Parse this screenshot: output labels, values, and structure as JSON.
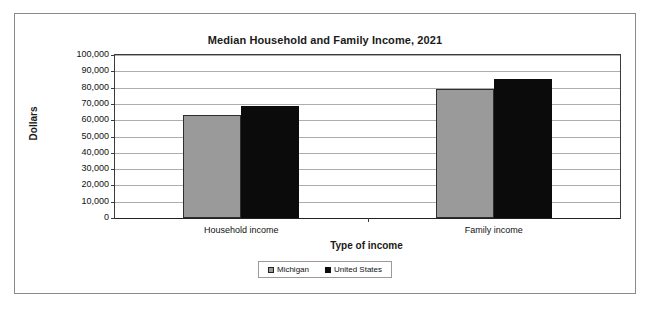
{
  "chart_data": {
    "type": "bar",
    "title": "Median Household and Family Income, 2021",
    "xlabel": "Type of income",
    "ylabel": "Dollars",
    "categories": [
      "Household income",
      "Family income"
    ],
    "series": [
      {
        "name": "Michigan",
        "color": "#9a9a9a",
        "values": [
          63000,
          79000
        ]
      },
      {
        "name": "United States",
        "color": "#0b0b0b",
        "values": [
          69000,
          85000
        ]
      }
    ],
    "ylim": [
      0,
      100000
    ],
    "ytick_values": [
      100000,
      90000,
      80000,
      70000,
      60000,
      50000,
      40000,
      30000,
      20000,
      10000,
      0
    ],
    "ytick_labels": [
      "100,000",
      "90,000",
      "80,000",
      "70,000",
      "60,000",
      "50,000",
      "40,000",
      "30,000",
      "20,000",
      "10,000",
      "0"
    ],
    "grid": true,
    "legend_position": "bottom"
  }
}
